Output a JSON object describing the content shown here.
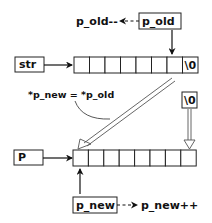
{
  "diagram": {
    "top_label_decrement": "p_old--",
    "p_old_box": "p_old",
    "str_box": "str",
    "top_array": {
      "cells": [
        "",
        "",
        "",
        "",
        "",
        "",
        "",
        "\\0"
      ]
    },
    "assignment_label": "*p_new = *p_old",
    "terminator_box": "\\0",
    "p_box": "P",
    "bottom_array": {
      "cells": [
        "",
        "",
        "",
        "",
        "",
        "",
        "",
        ""
      ]
    },
    "p_new_box": "p_new",
    "bottom_label_increment": "p_new++"
  }
}
